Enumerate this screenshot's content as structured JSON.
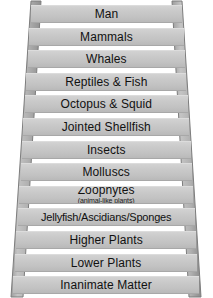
{
  "figure": {
    "name": "ladder-of-nature",
    "caption": "",
    "rung_fill_color": "#c8c8c8",
    "rail_fill_color": "#b0b0b0",
    "text_color": "#111111",
    "background_color": "#ffffff"
  },
  "ladder": {
    "rail_left_name": "ladder-rail-left",
    "rail_right_name": "ladder-rail-right",
    "rungs": [
      {
        "label": "Man",
        "sublabel": ""
      },
      {
        "label": "Mammals",
        "sublabel": ""
      },
      {
        "label": "Whales",
        "sublabel": ""
      },
      {
        "label": "Reptiles & Fish",
        "sublabel": ""
      },
      {
        "label": "Octopus & Squid",
        "sublabel": ""
      },
      {
        "label": "Jointed Shellfish",
        "sublabel": ""
      },
      {
        "label": "Insects",
        "sublabel": ""
      },
      {
        "label": "Molluscs",
        "sublabel": ""
      },
      {
        "label": "Zoophytes",
        "sublabel": "(animal-like plants)"
      },
      {
        "label": "Jellyfish/Ascidians/Sponges",
        "sublabel": ""
      },
      {
        "label": "Higher Plants",
        "sublabel": ""
      },
      {
        "label": "Lower Plants",
        "sublabel": ""
      },
      {
        "label": "Inanimate Matter",
        "sublabel": ""
      }
    ]
  }
}
